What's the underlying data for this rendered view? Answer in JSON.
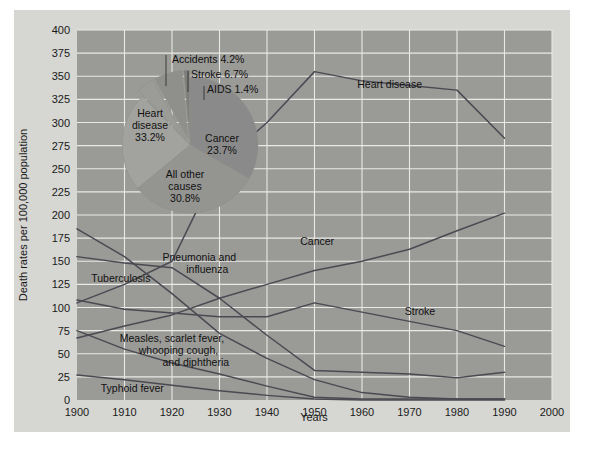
{
  "figure": {
    "background": "#d6d6d2",
    "plot_background": "#9a9a97",
    "grid_color": "#e9e9e6",
    "line_color": "#4a4a52"
  },
  "chart_data": {
    "type": "line",
    "title": "",
    "xlabel": "Years",
    "ylabel": "Death rates per 100,000 population",
    "xlim": [
      1900,
      2000
    ],
    "ylim": [
      0,
      400
    ],
    "grid": true,
    "legend": "inline-labels",
    "xticks": [
      1900,
      1910,
      1920,
      1930,
      1940,
      1950,
      1960,
      1970,
      1980,
      1990,
      2000
    ],
    "yticks": [
      0,
      25,
      50,
      75,
      100,
      125,
      150,
      175,
      200,
      225,
      250,
      275,
      300,
      325,
      350,
      375,
      400
    ],
    "x": [
      1900,
      1910,
      1920,
      1930,
      1940,
      1950,
      1960,
      1970,
      1980,
      1990
    ],
    "series": [
      {
        "name": "Heart disease",
        "label": "Heart disease",
        "values": [
          105,
          125,
          150,
          255,
          300,
          355,
          345,
          340,
          335,
          283
        ]
      },
      {
        "name": "Cancer",
        "label": "Cancer",
        "values": [
          67,
          80,
          92,
          110,
          125,
          140,
          150,
          163,
          183,
          202
        ]
      },
      {
        "name": "Stroke",
        "label": "Stroke",
        "values": [
          108,
          98,
          94,
          90,
          90,
          105,
          95,
          85,
          75,
          58
        ]
      },
      {
        "name": "Pneumonia and influenza",
        "label": "Pneumonia and influenza",
        "values": [
          155,
          148,
          143,
          110,
          70,
          32,
          30,
          28,
          24,
          30
        ]
      },
      {
        "name": "Tuberculosis",
        "label": "Tuberculosis",
        "values": [
          185,
          155,
          115,
          72,
          45,
          22,
          8,
          3,
          1,
          1
        ]
      },
      {
        "name": "Measles, scarlet fever, whooping cough, and diphtheria",
        "label": "Measles, scarlet fever, whooping cough, and diphtheria",
        "values": [
          75,
          55,
          40,
          28,
          15,
          3,
          1,
          1,
          1,
          1
        ]
      },
      {
        "name": "Typhoid fever",
        "label": "Typhoid fever",
        "values": [
          27,
          22,
          16,
          10,
          5,
          1,
          0,
          0,
          0,
          0
        ]
      }
    ],
    "series_labels": [
      {
        "text": "Heart disease",
        "x": 1959,
        "y": 337
      },
      {
        "text": "Cancer",
        "x": 1947,
        "y": 168
      },
      {
        "text": "Stroke",
        "x": 1969,
        "y": 92
      },
      {
        "text": "Tuberculosis",
        "x": 1903,
        "y": 128
      },
      {
        "text": "Pneumonia and",
        "x": 1918,
        "y": 150
      },
      {
        "text": "influenza",
        "x": 1923,
        "y": 137
      },
      {
        "text": "Measles, scarlet fever,",
        "x": 1909,
        "y": 63
      },
      {
        "text": "whooping cough,",
        "x": 1913,
        "y": 50
      },
      {
        "text": "and diphtheria",
        "x": 1918,
        "y": 37
      },
      {
        "text": "Typhoid fever",
        "x": 1905,
        "y": 9
      }
    ],
    "pie_inset": {
      "type": "pie",
      "title": "",
      "slices": [
        {
          "label": "Heart disease",
          "percent": 33.2,
          "value_text": "33.2%",
          "color": "#8a8a8a",
          "exploded": false
        },
        {
          "label": "All other causes",
          "percent": 30.8,
          "value_text": "30.8%",
          "color": "#949491",
          "exploded": false
        },
        {
          "label": "Cancer",
          "percent": 23.7,
          "value_text": "23.7%",
          "color": "#a2a29e",
          "exploded": false
        },
        {
          "label": "Accidents",
          "percent": 4.2,
          "value_text": "4.2%",
          "color": "#9b9b98",
          "exploded": true
        },
        {
          "label": "Stroke",
          "percent": 6.7,
          "value_text": "6.7%",
          "color": "#8f8f8c",
          "exploded": true
        },
        {
          "label": "AIDS",
          "percent": 1.4,
          "value_text": "1.4%",
          "color": "#7e7e7b",
          "exploded": true
        }
      ],
      "inner_labels": [
        {
          "line1": "Heart",
          "line2": "disease",
          "line3": "33.2%"
        },
        {
          "line1": "Cancer",
          "line2": "23.7%",
          "line3": ""
        },
        {
          "line1": "All other",
          "line2": "causes",
          "line3": "30.8%"
        }
      ],
      "callouts": [
        {
          "text": "Accidents 4.2%"
        },
        {
          "text": "Stroke 6.7%"
        },
        {
          "text": "AIDS 1.4%"
        }
      ]
    }
  }
}
